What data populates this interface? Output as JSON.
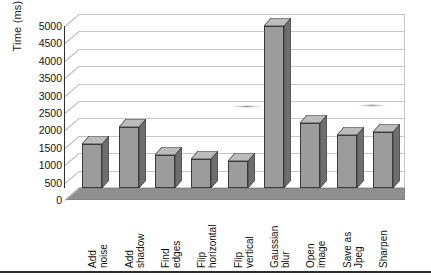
{
  "chart_data": {
    "type": "bar",
    "title": "",
    "xlabel": "",
    "ylabel": "Time (ms)",
    "ylim": [
      0,
      5000
    ],
    "ytick_step": 500,
    "grid": true,
    "legend": false,
    "three_d": true,
    "categories": [
      "Add noise",
      "Add shadow",
      "Find edges",
      "Flip horizontal",
      "Flip vertical",
      "Gaussian blur",
      "Open image",
      "Save as Jpeg",
      "Sharpen"
    ],
    "values": [
      1250,
      1750,
      950,
      830,
      780,
      4650,
      1870,
      1510,
      1600
    ],
    "ytick_labels": [
      "0",
      "500",
      "1000",
      "1500",
      "2000",
      "2500",
      "3000",
      "3500",
      "4000",
      "4500",
      "5000"
    ],
    "bar_colors": {
      "front": "#9c9c9c",
      "side": "#6e6e6e",
      "top": "#bcbcbc",
      "outline": "#3b3b3b"
    },
    "axis_color": "#2f2f2f",
    "grid_color": "#c6c6c6",
    "floor_color": "#8f8f8f",
    "background": "#ffffff"
  },
  "category_label_lines": [
    [
      "Add",
      "noise"
    ],
    [
      "Add",
      "shadow"
    ],
    [
      "Find",
      "edges"
    ],
    [
      "Flip",
      "horizontal"
    ],
    [
      "Flip",
      "vertical"
    ],
    [
      "Gaussian",
      "blur"
    ],
    [
      "Open",
      "image"
    ],
    [
      "Save as",
      "Jpeg"
    ],
    [
      "Sharpen"
    ]
  ]
}
